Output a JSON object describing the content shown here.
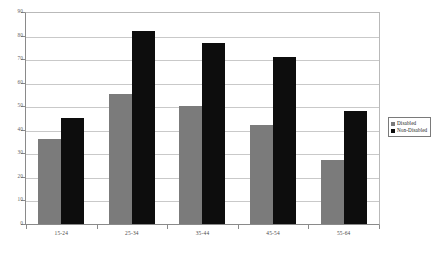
{
  "chart_data": {
    "type": "bar",
    "title": "",
    "subtitle": "",
    "xlabel": "",
    "ylabel": "",
    "categories": [
      "15-24",
      "25-34",
      "35-44",
      "45-54",
      "55-64"
    ],
    "series": [
      {
        "name": "Disabled",
        "color": "#7b7b7b",
        "values": [
          36,
          55,
          50,
          42,
          27
        ]
      },
      {
        "name": "Non-Disabled",
        "color": "#0d0d0d",
        "values": [
          45,
          82,
          77,
          71,
          48
        ]
      }
    ],
    "ylim": [
      0,
      90
    ],
    "ytick_step": 10,
    "ytick_labels": [
      "0",
      "10",
      "20",
      "30",
      "40",
      "50",
      "60",
      "70",
      "80",
      "90"
    ],
    "grid": true,
    "grid_axis": "y",
    "legend_position": "right",
    "legend_entries": [
      "Disabled",
      "Non-Disabled"
    ],
    "annotations": []
  }
}
